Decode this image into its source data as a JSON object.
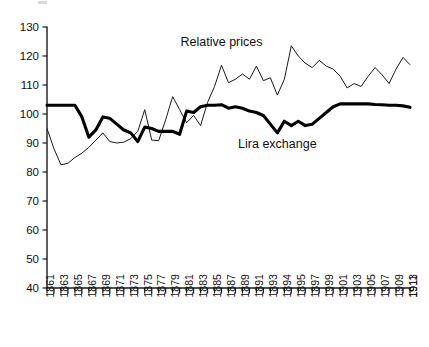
{
  "chart_data": {
    "type": "line",
    "title": "",
    "xlabel": "",
    "ylabel": "",
    "ylim": [
      40,
      130
    ],
    "xlim": [
      1861,
      1913
    ],
    "ytick_step": 10,
    "yticks": [
      40,
      50,
      60,
      70,
      80,
      90,
      100,
      110,
      120,
      130
    ],
    "grid": false,
    "legend_position": "inline-annotations",
    "xtick_labels": [
      "1861",
      "1863",
      "1865",
      "1867",
      "1869",
      "1871",
      "1873",
      "1875",
      "1877",
      "1879",
      "1881",
      "1883",
      "1885",
      "1887",
      "1889",
      "1891",
      "1893",
      "1894",
      "1895",
      "1897",
      "1999",
      "1901",
      "1903",
      "1905",
      "1907",
      "1909",
      "1911",
      "1913"
    ],
    "x": [
      1861,
      1862,
      1863,
      1864,
      1865,
      1866,
      1867,
      1868,
      1869,
      1870,
      1871,
      1872,
      1873,
      1874,
      1875,
      1876,
      1877,
      1878,
      1879,
      1880,
      1881,
      1882,
      1883,
      1884,
      1885,
      1886,
      1887,
      1888,
      1889,
      1890,
      1891,
      1892,
      1893,
      1894,
      1895,
      1896,
      1897,
      1898,
      1899,
      1900,
      1901,
      1902,
      1903,
      1904,
      1905,
      1906,
      1907,
      1908,
      1909,
      1910,
      1911,
      1912,
      1913
    ],
    "series": [
      {
        "name": "Relative prices",
        "style": "thin",
        "annotation": "Relative prices",
        "values": [
          95.0,
          88.0,
          82.5,
          83.0,
          85.0,
          86.5,
          88.5,
          91.0,
          93.5,
          90.5,
          90.0,
          90.3,
          91.5,
          94.0,
          101.5,
          91.0,
          90.8,
          98.0,
          106.0,
          101.5,
          97.0,
          99.5,
          96.0,
          104.0,
          109.5,
          116.8,
          110.8,
          112.0,
          113.8,
          112.0,
          116.5,
          111.5,
          112.5,
          106.5,
          112.0,
          123.5,
          120.0,
          117.5,
          116.0,
          118.5,
          116.5,
          115.5,
          113.0,
          109.0,
          110.5,
          109.5,
          113.0,
          116.0,
          113.5,
          110.5,
          115.5,
          119.5,
          117.0
        ]
      },
      {
        "name": "Lira exchange",
        "style": "thick",
        "annotation": "Lira exchange",
        "values": [
          103.0,
          103.0,
          103.0,
          103.0,
          103.0,
          99.0,
          92.0,
          94.5,
          99.0,
          98.5,
          96.5,
          94.5,
          93.5,
          90.5,
          95.5,
          95.0,
          94.0,
          94.0,
          94.0,
          93.0,
          101.0,
          100.5,
          102.5,
          103.0,
          103.0,
          103.2,
          102.0,
          102.5,
          102.0,
          101.0,
          100.5,
          99.5,
          96.5,
          93.5,
          97.5,
          96.0,
          97.5,
          96.0,
          96.5,
          98.5,
          100.5,
          102.5,
          103.5,
          103.5,
          103.5,
          103.5,
          103.5,
          103.3,
          103.2,
          103.0,
          103.0,
          102.8,
          102.3
        ]
      }
    ],
    "annotations": [
      {
        "text": "Relative prices",
        "x": 1886,
        "y": 124.5
      },
      {
        "text": "Lira exchange",
        "x": 1894,
        "y": 89.5
      }
    ]
  },
  "colors": {
    "ink": "#1a1a1a",
    "background": "#ffffff",
    "thick_series": "#000000",
    "thin_series": "#1a1a1a"
  }
}
